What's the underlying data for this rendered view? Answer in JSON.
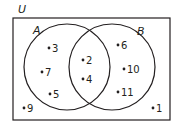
{
  "diagram": {
    "type": "venn",
    "universe_label": "U",
    "sets": [
      {
        "label": "A",
        "only_elements": [
          "3",
          "7",
          "5"
        ]
      },
      {
        "label": "B",
        "only_elements": [
          "6",
          "10",
          "11"
        ]
      }
    ],
    "intersection_elements": [
      "2",
      "4"
    ],
    "outside_elements": [
      "9",
      "1"
    ],
    "colors": {
      "stroke": "#231f20",
      "background": "#ffffff"
    }
  },
  "labels": {
    "u": "U",
    "a": "A",
    "b": "B",
    "e3": "3",
    "e7": "7",
    "e5": "5",
    "e2": "2",
    "e4": "4",
    "e6": "6",
    "e10": "10",
    "e11": "11",
    "e9": "9",
    "e1": "1"
  }
}
